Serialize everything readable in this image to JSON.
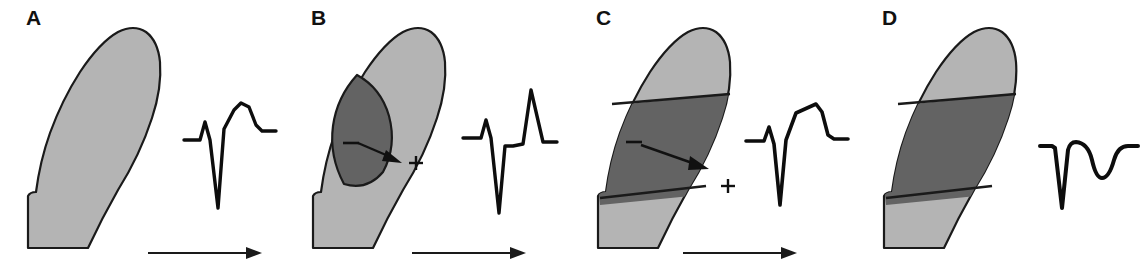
{
  "figure": {
    "kind": "medical-illustration",
    "width": 1141,
    "height": 275,
    "background_color": "#ffffff"
  },
  "palette": {
    "normal_myocardium_fill": "#b4b4b4",
    "infarct_fill": "#636363",
    "outline": "#1a1a1a",
    "trace": "#0d0d0d",
    "label": "#111111"
  },
  "panels": [
    {
      "id": "panel-a",
      "label": "A",
      "x": 0,
      "wall": {
        "description": "normal myocardial wall, uniformly light gray",
        "infarct_zone": "none",
        "infarct_type": "none"
      },
      "symbols": [],
      "direction_arrow": {
        "present": true,
        "label": "depolarization-direction-arrow",
        "orientation": "left-to-right"
      },
      "ecg": {
        "name": "ecg-trace-a",
        "description": "normal complex: small R, deep narrow S, upright rounded T wave",
        "features": [
          "small R wave",
          "deep S wave",
          "upright rounded T wave"
        ]
      }
    },
    {
      "id": "panel-b",
      "label": "B",
      "x": 285,
      "wall": {
        "description": "subendocardial ischemic zone, dark lens against inner border",
        "infarct_zone": "subendocardial",
        "infarct_type": "partial-thickness"
      },
      "symbols": [
        {
          "name": "minus-sign",
          "glyph": "−",
          "x": 108,
          "y": 140
        },
        {
          "name": "plus-sign",
          "glyph": "+",
          "x": 131,
          "y": 155
        }
      ],
      "injury_vector_arrow": {
        "present": true,
        "label": "injury-current-vector-arrow",
        "orientation": "inward-to-outward"
      },
      "direction_arrow": {
        "present": true,
        "label": "depolarization-direction-arrow",
        "orientation": "left-to-right"
      },
      "ecg": {
        "name": "ecg-trace-b",
        "description": "small R, deep narrow S, isoelectric ST, tall peaked hyperacute T wave",
        "features": [
          "small R wave",
          "deep S wave",
          "isoelectric ST segment",
          "tall peaked T wave"
        ]
      }
    },
    {
      "id": "panel-c",
      "label": "C",
      "x": 570,
      "wall": {
        "description": "transmural injury band spanning full wall thickness",
        "infarct_zone": "transmural",
        "infarct_type": "full-thickness-injury"
      },
      "symbols": [
        {
          "name": "minus-sign",
          "glyph": "−",
          "x": 62,
          "y": 142
        },
        {
          "name": "plus-sign",
          "glyph": "+",
          "x": 158,
          "y": 179
        }
      ],
      "injury_vector_arrow": {
        "present": true,
        "label": "injury-current-vector-arrow",
        "orientation": "inward-to-outward"
      },
      "direction_arrow": {
        "present": true,
        "label": "depolarization-direction-arrow",
        "orientation": "left-to-right"
      },
      "ecg": {
        "name": "ecg-trace-c",
        "description": "small R, deep S, marked ST segment elevation forming a raised plateau",
        "features": [
          "small R wave",
          "deep S wave",
          "ST segment elevation",
          "plateau"
        ]
      }
    },
    {
      "id": "panel-d",
      "label": "D",
      "x": 856,
      "wall": {
        "description": "established transmural infarct, dark band, no injury vector",
        "infarct_zone": "transmural",
        "infarct_type": "completed-infarct"
      },
      "symbols": [],
      "injury_vector_arrow": {
        "present": false
      },
      "direction_arrow": {
        "present": false
      },
      "ecg": {
        "name": "ecg-trace-d",
        "description": "deep QS complex followed by a rounded inverted T wave",
        "features": [
          "deep QS complex",
          "no R wave",
          "inverted T wave"
        ]
      }
    }
  ]
}
